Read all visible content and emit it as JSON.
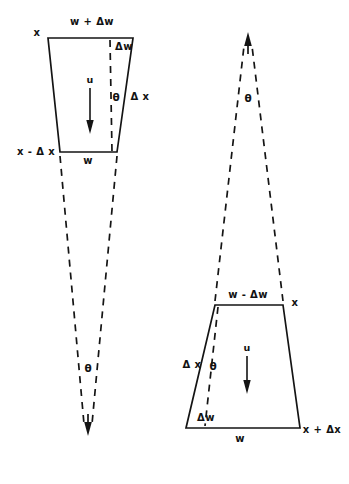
{
  "figure": {
    "stroke_color": "#141414",
    "background_color": "#ffffff",
    "solid_stroke_width": 1.7,
    "dashed_stroke_width": 1.7,
    "dash_pattern": "7,6"
  },
  "upper_left_element": {
    "name": "upper-left-control-volume",
    "top_width_label": "w + Δw",
    "bottom_width_label": "w",
    "top_position_label": "x",
    "bottom_position_label": "x - Δ x",
    "thickness_label": "Δ x",
    "width_increment_label": "Δw",
    "angle_label": "θ",
    "velocity_label": "u",
    "cone_angle_label": "θ",
    "trapezoid": {
      "top_left": [
        48,
        38
      ],
      "top_right": [
        133,
        38
      ],
      "bottom_right": [
        117,
        152
      ],
      "bottom_left": [
        60,
        152
      ]
    }
  },
  "lower_right_element": {
    "name": "lower-right-control-volume",
    "top_width_label": "w - Δw",
    "bottom_width_label": "w",
    "top_position_label": "x",
    "bottom_position_label": "x + Δx",
    "thickness_label": "Δ x",
    "width_increment_label": "Δw",
    "angle_label": "θ",
    "velocity_label": "u",
    "cone_angle_label": "θ",
    "trapezoid": {
      "top_left": [
        215,
        305
      ],
      "top_right": [
        283,
        305
      ],
      "bottom_right": [
        300,
        428
      ],
      "bottom_left": [
        186,
        428
      ]
    }
  },
  "labels": {
    "ul_top_width": "w + Δw",
    "ul_x": "x",
    "ul_delta_w": "Δw",
    "ul_u": "u",
    "ul_theta": "θ",
    "ul_delta_x_side": "Δ x",
    "ul_x_minus_delta_x": "x - Δ x",
    "ul_w_bottom": "w",
    "ul_cone_theta": "θ",
    "lr_cone_theta": "θ",
    "lr_top_width": "w - Δw",
    "lr_x": "x",
    "lr_delta_x_side": "Δ x",
    "lr_theta": "θ",
    "lr_u": "u",
    "lr_delta_w": "Δw",
    "lr_w_bottom": "w",
    "lr_x_plus_delta_x": "x + Δx"
  }
}
